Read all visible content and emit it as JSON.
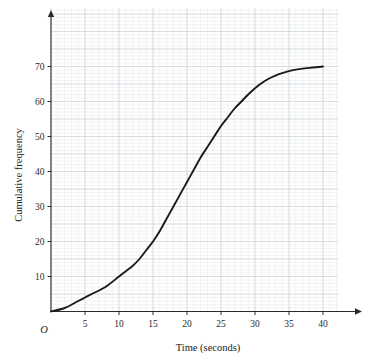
{
  "chart_data": {
    "type": "line",
    "title": "",
    "subtitle": "",
    "xlabel": "Time (seconds)",
    "ylabel": "Cumulative frequency",
    "origin_label": "O",
    "xlim": [
      0,
      42
    ],
    "ylim": [
      0,
      75
    ],
    "x_ticks": [
      5,
      10,
      15,
      20,
      25,
      30,
      35,
      40
    ],
    "x_tick_labels": [
      "5",
      "10",
      "15",
      "20",
      "25",
      "30",
      "35",
      "40"
    ],
    "y_ticks": [
      10,
      20,
      30,
      40,
      50,
      60,
      70
    ],
    "y_tick_labels": [
      "10",
      "20",
      "30",
      "40",
      "50",
      "60",
      "70"
    ],
    "grid": true,
    "grid_major_step_x": 5,
    "grid_major_step_y": 5,
    "grid_minor_step_x": 1,
    "grid_minor_step_y": 1,
    "legend": [],
    "legend_position": "none",
    "annotations": [],
    "series": [
      {
        "name": "Cumulative frequency",
        "color": "#1a1a1a",
        "x": [
          0,
          2,
          4,
          5,
          6,
          8,
          10,
          11,
          12,
          13,
          14,
          15,
          16,
          17,
          18,
          19,
          20,
          21,
          22,
          23,
          24,
          25,
          26,
          27,
          28,
          29,
          30,
          31,
          32,
          33,
          34,
          35,
          36,
          37,
          38,
          39,
          40
        ],
        "values": [
          0,
          1,
          3,
          4,
          5,
          7,
          10,
          11.5,
          13,
          15,
          17.5,
          20,
          23,
          26.5,
          30,
          33.5,
          37,
          40.5,
          44,
          47,
          50,
          53,
          55.5,
          58,
          60,
          62,
          63.8,
          65.3,
          66.5,
          67.4,
          68.1,
          68.7,
          69.1,
          69.4,
          69.6,
          69.8,
          70
        ]
      }
    ],
    "colors": {
      "curve": "#1a1a1a",
      "axis": "#2b2b2b",
      "grid_major": "#cfd4da",
      "grid_minor": "#e8ebee",
      "background": "#ffffff"
    }
  }
}
